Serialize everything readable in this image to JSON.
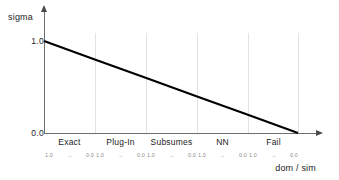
{
  "chart_data": {
    "type": "line",
    "title": "",
    "subtitle": "",
    "xlabel": "dom / sim",
    "ylabel": "sigma",
    "ylim": [
      0.0,
      1.0
    ],
    "xlim": [
      0,
      5
    ],
    "grid": true,
    "legend": null,
    "y_ticks": [
      "1.0",
      "0.0"
    ],
    "y_tick_values": [
      1.0,
      0.0
    ],
    "categories": [
      "Exact",
      "Plug-In",
      "Subsumes",
      "NN",
      "Fail"
    ],
    "band_subticks": [
      "1.0",
      "→",
      "0.0"
    ],
    "series": [
      {
        "name": "sigma",
        "color": "#000000",
        "x": [
          0,
          5
        ],
        "values": [
          1.0,
          0.0
        ],
        "points": [
          {
            "x": 0,
            "y": 1.0
          },
          {
            "x": 1,
            "y": 0.8
          },
          {
            "x": 2,
            "y": 0.6
          },
          {
            "x": 3,
            "y": 0.4
          },
          {
            "x": 4,
            "y": 0.2
          },
          {
            "x": 5,
            "y": 0.0
          }
        ]
      }
    ],
    "annotations": []
  },
  "axes": {
    "y_label": "sigma",
    "x_label": "dom / sim",
    "y_tick_top": "1.0",
    "y_tick_bottom": "0.0"
  },
  "bands": [
    {
      "label": "Exact",
      "from": "1.0",
      "arrow": "→",
      "to": "0.0"
    },
    {
      "label": "Plug-In",
      "from": "1.0",
      "arrow": "→",
      "to": "0.0"
    },
    {
      "label": "Subsumes",
      "from": "1.0",
      "arrow": "→",
      "to": "0.0"
    },
    {
      "label": "NN",
      "from": "1.0",
      "arrow": "→",
      "to": "0.0"
    },
    {
      "label": "Fail",
      "from": "1.0",
      "arrow": "→",
      "to": "0.0"
    }
  ],
  "colors": {
    "line": "#000000",
    "axis": "#6e6e6e",
    "grid": "#e2e2e2",
    "text": "#1c1c1c",
    "subtick_text": "#8d8d8d",
    "background": "#ffffff"
  }
}
